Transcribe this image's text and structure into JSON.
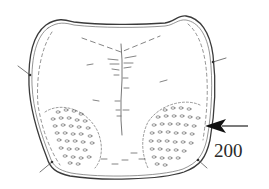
{
  "figure": {
    "label": "200",
    "annotations": {
      "arrow": {
        "direction": "left",
        "points_to": "punctured lateral area"
      }
    },
    "colors": {
      "ink": "#3a3a3a",
      "background": "#ffffff"
    }
  }
}
